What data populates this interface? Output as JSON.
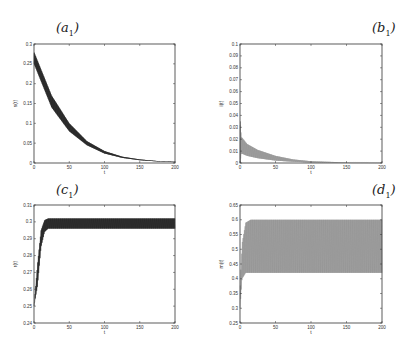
{
  "figure": {
    "panels": [
      {
        "id": "a",
        "label": "a",
        "sub": "1"
      },
      {
        "id": "b",
        "label": "b",
        "sub": "1"
      },
      {
        "id": "c",
        "label": "c",
        "sub": "1"
      },
      {
        "id": "d",
        "label": "d",
        "sub": "1"
      }
    ]
  },
  "chart_data": [
    {
      "panel": "(a1)",
      "type": "line",
      "title": "(a1)",
      "xlabel": "t",
      "ylabel": "s(t)",
      "xlim": [
        0,
        200
      ],
      "ylim": [
        0,
        0.3
      ],
      "xticks": [
        "0",
        "50",
        "100",
        "150",
        "200"
      ],
      "yticks": [
        "0",
        "0.05",
        "0.1",
        "0.15",
        "0.2",
        "0.25",
        "0.3"
      ],
      "grid": false,
      "style": "dense oscillating band, black",
      "series": [
        {
          "name": "upper envelope",
          "x": [
            0,
            25,
            50,
            75,
            100,
            125,
            150,
            175,
            200
          ],
          "values": [
            0.28,
            0.17,
            0.1,
            0.055,
            0.03,
            0.016,
            0.009,
            0.005,
            0.003
          ]
        },
        {
          "name": "lower envelope",
          "x": [
            0,
            25,
            50,
            75,
            100,
            125,
            150,
            175,
            200
          ],
          "values": [
            0.25,
            0.14,
            0.08,
            0.045,
            0.024,
            0.013,
            0.007,
            0.004,
            0.002
          ]
        }
      ]
    },
    {
      "panel": "(b1)",
      "type": "line",
      "title": "(b1)",
      "xlabel": "t",
      "ylabel": "i(t)",
      "xlim": [
        0,
        200
      ],
      "ylim": [
        0,
        0.1
      ],
      "xticks": [
        "0",
        "50",
        "100",
        "150",
        "200"
      ],
      "yticks": [
        "0",
        "0.01",
        "0.02",
        "0.03",
        "0.04",
        "0.05",
        "0.06",
        "0.07",
        "0.08",
        "0.09",
        "0.1"
      ],
      "grid": false,
      "style": "dense oscillating band, gray",
      "series": [
        {
          "name": "upper envelope",
          "x": [
            0,
            2,
            10,
            25,
            50,
            75,
            100,
            150,
            200
          ],
          "values": [
            0.035,
            0.022,
            0.016,
            0.011,
            0.006,
            0.003,
            0.0015,
            0.0005,
            0.0002
          ]
        },
        {
          "name": "lower envelope",
          "x": [
            0,
            2,
            10,
            25,
            50,
            75,
            100,
            150,
            200
          ],
          "values": [
            0.0,
            0.008,
            0.006,
            0.004,
            0.002,
            0.001,
            0.0005,
            0.0002,
            0.0001
          ]
        }
      ]
    },
    {
      "panel": "(c1)",
      "type": "line",
      "title": "(c1)",
      "xlabel": "t",
      "ylabel": "r(t)",
      "xlim": [
        0,
        200
      ],
      "ylim": [
        0.24,
        0.31
      ],
      "xticks": [
        "0",
        "50",
        "100",
        "150",
        "200"
      ],
      "yticks": [
        "0.24",
        "0.25",
        "0.26",
        "0.27",
        "0.28",
        "0.29",
        "0.3",
        "0.31"
      ],
      "grid": false,
      "style": "dense oscillating band, black",
      "series": [
        {
          "name": "upper envelope",
          "x": [
            0,
            5,
            10,
            15,
            20,
            50,
            100,
            150,
            200
          ],
          "values": [
            0.25,
            0.275,
            0.295,
            0.301,
            0.302,
            0.302,
            0.302,
            0.302,
            0.302
          ]
        },
        {
          "name": "lower envelope",
          "x": [
            0,
            5,
            10,
            15,
            20,
            50,
            100,
            150,
            200
          ],
          "values": [
            0.25,
            0.262,
            0.285,
            0.294,
            0.296,
            0.296,
            0.296,
            0.296,
            0.296
          ]
        }
      ]
    },
    {
      "panel": "(d1)",
      "type": "line",
      "title": "(d1)",
      "xlabel": "t",
      "ylabel": "m(t)",
      "xlim": [
        0,
        200
      ],
      "ylim": [
        0.25,
        0.65
      ],
      "xticks": [
        "0",
        "50",
        "100",
        "150",
        "200"
      ],
      "yticks": [
        "0.25",
        "0.3",
        "0.35",
        "0.4",
        "0.45",
        "0.5",
        "0.55",
        "0.6",
        "0.65"
      ],
      "grid": false,
      "style": "dense oscillating band, gray",
      "series": [
        {
          "name": "upper envelope",
          "x": [
            0,
            3,
            8,
            15,
            50,
            100,
            150,
            200
          ],
          "values": [
            0.35,
            0.52,
            0.59,
            0.6,
            0.6,
            0.6,
            0.6,
            0.6
          ]
        },
        {
          "name": "lower envelope",
          "x": [
            0,
            3,
            8,
            15,
            50,
            100,
            150,
            200
          ],
          "values": [
            0.3,
            0.4,
            0.42,
            0.42,
            0.42,
            0.42,
            0.42,
            0.42
          ]
        }
      ]
    }
  ]
}
